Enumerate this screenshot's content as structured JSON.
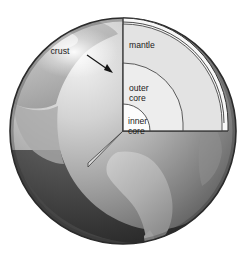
{
  "figure": {
    "kind": "earth-cutaway-diagram",
    "background_color": "#ffffff",
    "width": 250,
    "height": 260
  },
  "globe": {
    "name": "earth-globe",
    "center": {
      "x": 123,
      "y": 131
    },
    "radius": 113,
    "outline_color": "#2b2b2b",
    "ocean_color": "#3a3a3a",
    "land_color": "#b8b8b8",
    "highlight_color": "#e6e6e6",
    "shadow_color": "#6e6e6e"
  },
  "layers": [
    {
      "id": "crust",
      "label": "crust",
      "label_lines": [
        "crust"
      ],
      "fill": "#f5f5f5",
      "stroke": "#3a3a3a",
      "outer_radius": 108,
      "inner_radius": 103,
      "has_leader_arrow": true
    },
    {
      "id": "mantle",
      "label": "mantle",
      "label_lines": [
        "mantle"
      ],
      "fill": "#e2e2e2",
      "stroke": "#4a4a4a",
      "outer_radius": 103,
      "inner_radius": 64
    },
    {
      "id": "outer-core",
      "label": "outer core",
      "label_lines": [
        "outer",
        "core"
      ],
      "fill": "#ededed",
      "stroke": "#4a4a4a",
      "outer_radius": 64,
      "inner_radius": 28
    },
    {
      "id": "inner-core",
      "label": "inner core",
      "label_lines": [
        "inner",
        "core"
      ],
      "fill": "#fbfbfb",
      "stroke": "#4a4a4a",
      "outer_radius": 28,
      "inner_radius": 0
    }
  ],
  "labels": {
    "crust": {
      "text": "crust",
      "x": 60,
      "y": 51
    },
    "mantle": {
      "text": "mantle",
      "x": 129,
      "y": 45
    },
    "outer_core_line1": {
      "text": "outer",
      "x": 129,
      "y": 89
    },
    "outer_core_line2": {
      "text": "core",
      "x": 129,
      "y": 99
    },
    "inner_core_line1": {
      "text": "inner",
      "x": 128,
      "y": 122
    },
    "inner_core_line2": {
      "text": "core",
      "x": 128,
      "y": 132
    }
  },
  "annotations": {
    "crust_arrow": {
      "name": "crust-leader-arrow",
      "from": {
        "x": 87,
        "y": 55
      },
      "to": {
        "x": 112,
        "y": 72
      }
    }
  }
}
